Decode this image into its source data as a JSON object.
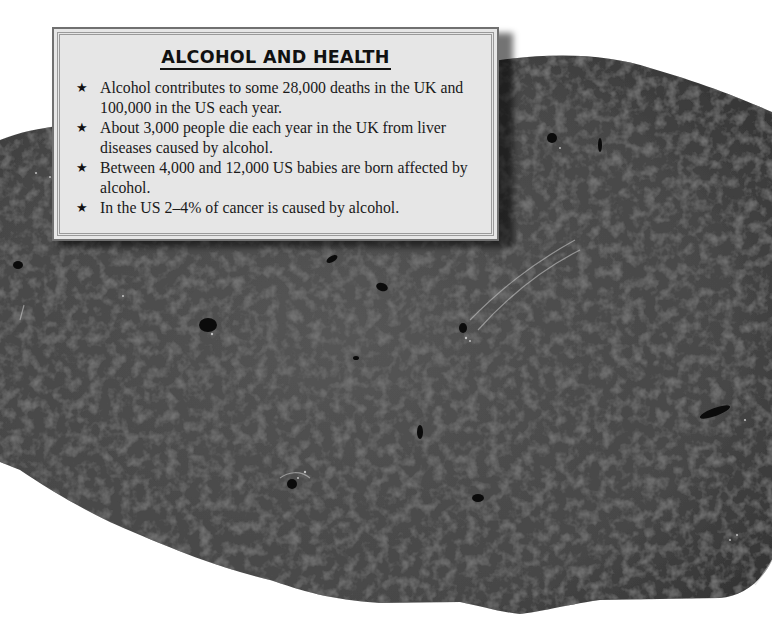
{
  "info_box": {
    "title": "ALCOHOL AND HEALTH",
    "bullet_icon": "star-icon",
    "facts": [
      {
        "text": "Alcohol contributes to some 28,000 deaths in the UK and 100,000 in the US each year."
      },
      {
        "text": "About 3,000 people die each year in the UK from liver diseases caused by alcohol."
      },
      {
        "text": "Between 4,000 and 12,000 US babies are born affected by alcohol."
      },
      {
        "text": "In the US 2–4% of cancer is caused by alcohol."
      }
    ],
    "bullet_glyph": "★"
  },
  "photo": {
    "subject": "liver-tissue-photo",
    "colors": {
      "tissue_base": "#4a4a4a",
      "tissue_dark": "#2a2a2a",
      "tissue_light": "#6a6a6a",
      "vessel": "#0a0a0a",
      "box_background": "#e6e6e6",
      "box_border": "#707070"
    }
  }
}
